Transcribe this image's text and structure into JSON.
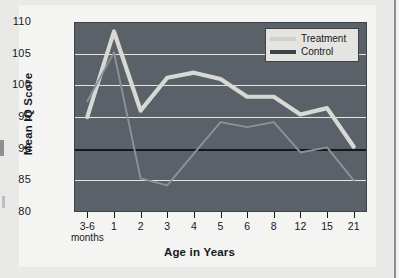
{
  "chart_data": {
    "type": "line",
    "title": "",
    "xlabel": "Age in Years",
    "ylabel": "Mean IQ Score",
    "ylim": [
      80,
      110
    ],
    "yticks": [
      80,
      85,
      90,
      95,
      100,
      105,
      110
    ],
    "grid": true,
    "reference_line": 90,
    "legend_position": "top-right",
    "categories": [
      "3-6 months",
      "1",
      "2",
      "3",
      "4",
      "5",
      "6",
      "8",
      "12",
      "15",
      "21"
    ],
    "series": [
      {
        "name": "Treatment",
        "color": "#d8d8d4",
        "values": [
          95.0,
          108.5,
          96.0,
          101.2,
          102.0,
          101.0,
          98.2,
          98.2,
          95.4,
          96.4,
          90.3
        ]
      },
      {
        "name": "Control",
        "color": "#8d9299",
        "values": [
          97.5,
          105.2,
          85.3,
          84.2,
          89.2,
          94.2,
          93.4,
          94.2,
          89.4,
          90.2,
          85.0
        ]
      }
    ]
  },
  "axis": {
    "y_labels": [
      "110",
      "105",
      "100",
      "95",
      "90",
      "85",
      "80"
    ],
    "x_labels": [
      {
        "main": "3-6",
        "sub": "months"
      },
      {
        "main": "1",
        "sub": ""
      },
      {
        "main": "2",
        "sub": ""
      },
      {
        "main": "3",
        "sub": ""
      },
      {
        "main": "4",
        "sub": ""
      },
      {
        "main": "5",
        "sub": ""
      },
      {
        "main": "6",
        "sub": ""
      },
      {
        "main": "8",
        "sub": ""
      },
      {
        "main": "12",
        "sub": ""
      },
      {
        "main": "15",
        "sub": ""
      },
      {
        "main": "21",
        "sub": ""
      }
    ],
    "x_title": "Age in Years",
    "y_title": "Mean IQ Score"
  },
  "legend": {
    "treatment_label": "Treatment",
    "control_label": "Control"
  },
  "colors": {
    "plot_background": "#5b6169",
    "gridline": "#e6e6e2",
    "reference_line": "#15181c",
    "treatment": "#d8d8d4",
    "control": "#8d9299",
    "page_background": "#e9e9e7",
    "card_background": "#f4f4f2"
  }
}
